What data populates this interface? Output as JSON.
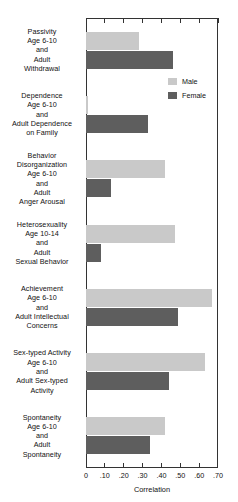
{
  "chart_data": {
    "type": "bar",
    "orientation": "horizontal",
    "title": "",
    "xlabel": "Correlation",
    "ylabel": "",
    "xlim": [
      0,
      0.7
    ],
    "xticks": [
      0,
      0.1,
      0.2,
      0.3,
      0.4,
      0.5,
      0.6,
      0.7
    ],
    "xtick_labels": [
      "0",
      ".10",
      ".20",
      ".30",
      ".40",
      ".50",
      ".60",
      ".70"
    ],
    "grid": false,
    "legend_position": "upper right inside",
    "categories": [
      "Passivity Age 6-10 and Adult Withdrawal",
      "Dependence Age 6-10 and Adult Dependence on Family",
      "Behavior Disorganization Age 6-10 and Adult Anger Arousal",
      "Heterosexuality Age 10-14 and Adult Sexual Behavior",
      "Achievement Age 6-10 and Adult Intellectual Concerns",
      "Sex-typed Activity Age 6-10 and Adult Sex-typed Activity",
      "Spontaneity Age 6-10 and Adult Spontaneity"
    ],
    "series": [
      {
        "name": "Male",
        "color": "#c9c9c9",
        "values": [
          0.28,
          0.01,
          0.42,
          0.47,
          0.67,
          0.63,
          0.42
        ]
      },
      {
        "name": "Female",
        "color": "#5e5e5e",
        "values": [
          0.46,
          0.33,
          0.13,
          0.08,
          0.49,
          0.44,
          0.34
        ]
      }
    ]
  },
  "category_label_lines": [
    [
      "Passivity",
      "Age 6-10",
      "and",
      "Adult",
      "Withdrawal"
    ],
    [
      "Dependence",
      "Age 6-10",
      "and",
      "Adult Dependence",
      "on Family"
    ],
    [
      "Behavior",
      "Disorganization",
      "Age 6-10",
      "and",
      "Adult",
      "Anger Arousal"
    ],
    [
      "Heterosexuality",
      "Age 10-14",
      "and",
      "Adult",
      "Sexual Behavior"
    ],
    [
      "Achievement",
      "Age 6-10",
      "and",
      "Adult Intellectual",
      "Concerns"
    ],
    [
      "Sex-typed Activity",
      "Age 6-10",
      "and",
      "Adult Sex-typed",
      "Activity"
    ],
    [
      "Spontaneity",
      "Age 6-10",
      "and",
      "Adult",
      "Spontaneity"
    ]
  ],
  "legend": {
    "entries": [
      {
        "label": "Male",
        "color": "#c9c9c9"
      },
      {
        "label": "Female",
        "color": "#5e5e5e"
      }
    ]
  },
  "axis": {
    "title": "Correlation"
  },
  "colors": {
    "male_bar": "#c9c9c9",
    "female_bar": "#5e5e5e",
    "frame": "#333333",
    "background": "#ffffff"
  }
}
